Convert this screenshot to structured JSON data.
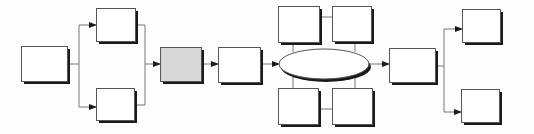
{
  "diagram": {
    "title": "",
    "colors": {
      "background": "#fdfdfd",
      "box_fill": "#ffffff",
      "highlight_fill": "#d8d8d8",
      "stroke": "#555555",
      "shadow": "#1a1a1a",
      "connector": "#777777"
    },
    "nodes": [
      {
        "id": "n1",
        "shape": "rect",
        "x": 21,
        "y": 46,
        "w": 46,
        "h": 35,
        "fill": "box_fill",
        "label": ""
      },
      {
        "id": "n2",
        "shape": "rect",
        "x": 96,
        "y": 8,
        "w": 39,
        "h": 33,
        "fill": "box_fill",
        "label": ""
      },
      {
        "id": "n3",
        "shape": "rect",
        "x": 96,
        "y": 88,
        "w": 38,
        "h": 32,
        "fill": "box_fill",
        "label": ""
      },
      {
        "id": "n4",
        "shape": "rect",
        "x": 160,
        "y": 47,
        "w": 41,
        "h": 34,
        "fill": "highlight_fill",
        "label": ""
      },
      {
        "id": "n5",
        "shape": "rect",
        "x": 218,
        "y": 47,
        "w": 42,
        "h": 35,
        "fill": "box_fill",
        "label": ""
      },
      {
        "id": "n6",
        "shape": "ellipse",
        "cx": 324,
        "cy": 64,
        "rx": 45,
        "ry": 15,
        "fill": "box_fill",
        "label": ""
      },
      {
        "id": "n7",
        "shape": "rect",
        "x": 278,
        "y": 6,
        "w": 41,
        "h": 36,
        "fill": "box_fill",
        "label": ""
      },
      {
        "id": "n8",
        "shape": "rect",
        "x": 332,
        "y": 6,
        "w": 39,
        "h": 35,
        "fill": "box_fill",
        "label": ""
      },
      {
        "id": "n9",
        "shape": "rect",
        "x": 278,
        "y": 88,
        "w": 40,
        "h": 36,
        "fill": "box_fill",
        "label": ""
      },
      {
        "id": "n10",
        "shape": "rect",
        "x": 332,
        "y": 88,
        "w": 40,
        "h": 36,
        "fill": "box_fill",
        "label": ""
      },
      {
        "id": "n11",
        "shape": "rect",
        "x": 389,
        "y": 48,
        "w": 46,
        "h": 34,
        "fill": "box_fill",
        "label": ""
      },
      {
        "id": "n12",
        "shape": "rect",
        "x": 462,
        "y": 9,
        "w": 38,
        "h": 33,
        "fill": "box_fill",
        "label": ""
      },
      {
        "id": "n13",
        "shape": "rect",
        "x": 461,
        "y": 89,
        "w": 38,
        "h": 33,
        "fill": "box_fill",
        "label": ""
      }
    ],
    "edges": [
      {
        "from": "n1",
        "to": "n2",
        "path": "M67,64 L79,64 L79,25 L96,25",
        "arrow": true
      },
      {
        "from": "n1",
        "to": "n3",
        "path": "M79,64 L79,107 L96,107",
        "arrow": true
      },
      {
        "from": "n2",
        "to": "n4",
        "path": "M135,25 L145,25 L145,105 L134,105",
        "arrow": false
      },
      {
        "from": "n3",
        "to": "n4",
        "path": "M145,64 L160,64",
        "arrow": true
      },
      {
        "from": "n4",
        "to": "n5",
        "path": "M201,64 L218,64",
        "arrow": true
      },
      {
        "from": "n5",
        "to": "n6",
        "path": "M260,64 L279,64",
        "arrow": true
      },
      {
        "from": "n7",
        "to": "n6",
        "path": "M293,42 L293,52",
        "arrow": false
      },
      {
        "from": "n8",
        "to": "n6",
        "path": "M355,41 L355,52",
        "arrow": false
      },
      {
        "from": "n7",
        "to": "n8",
        "path": "M319,17 L332,17",
        "arrow": false
      },
      {
        "from": "n6",
        "to": "n9",
        "path": "M293,77 L293,88",
        "arrow": false
      },
      {
        "from": "n6",
        "to": "n10",
        "path": "M355,77 L355,88",
        "arrow": false
      },
      {
        "from": "n9",
        "to": "n10",
        "path": "M318,109 L332,109",
        "arrow": false
      },
      {
        "from": "n6",
        "to": "n11",
        "path": "M369,64 L389,64",
        "arrow": true
      },
      {
        "from": "n11",
        "to": "n12",
        "path": "M435,66 L444,66 L444,29 L462,29",
        "arrow": true
      },
      {
        "from": "n11",
        "to": "n13",
        "path": "M444,66 L444,112 L461,112",
        "arrow": true
      }
    ]
  }
}
